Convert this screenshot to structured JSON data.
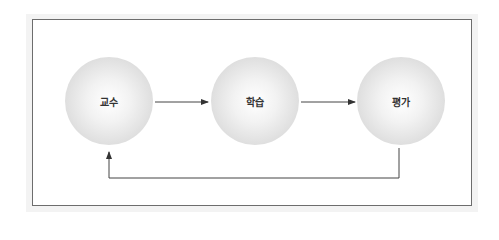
{
  "diagram": {
    "type": "cycle-flow",
    "nodes": [
      {
        "id": "teaching",
        "label": "교수"
      },
      {
        "id": "learning",
        "label": "학습"
      },
      {
        "id": "evaluation",
        "label": "평가"
      }
    ],
    "edges": [
      {
        "from": "teaching",
        "to": "learning"
      },
      {
        "from": "learning",
        "to": "evaluation"
      },
      {
        "from": "evaluation",
        "to": "teaching",
        "style": "feedback-loop-below"
      }
    ],
    "colors": {
      "border": "#6d6d6d",
      "line": "#444444",
      "node_fill": "#e6e6e6",
      "text": "#333333"
    }
  }
}
